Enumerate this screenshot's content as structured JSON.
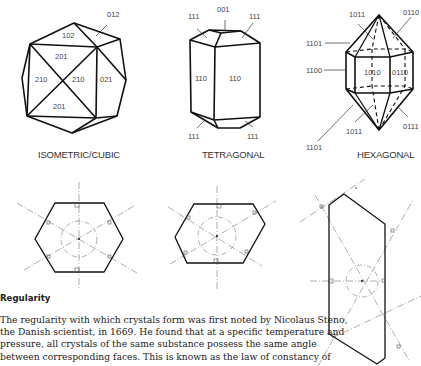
{
  "figure": {
    "crystals": [
      {
        "caption": "ISOMETRIC/CUBIC",
        "face_labels": [
          "012",
          "102",
          "201",
          "210",
          "210",
          "021",
          "201"
        ]
      },
      {
        "caption": "TETRAGONAL",
        "face_labels": [
          "001",
          "111",
          "111",
          "110",
          "110",
          "111",
          "111"
        ]
      },
      {
        "caption": "HEXAGONAL",
        "face_labels": [
          "1011",
          "0110",
          "1101",
          "1100",
          "1010",
          "0110",
          "1011",
          "0111",
          "1101"
        ]
      }
    ],
    "cross_sections": [
      {
        "name": "regular-hexagon-section"
      },
      {
        "name": "distorted-hexagon-section"
      },
      {
        "name": "elongated-hexagon-section"
      }
    ]
  },
  "section": {
    "heading": "Regularity",
    "lines": [
      "The regularity with which crystals form was first noted by Nicolaus Steno,",
      "the Danish scientist, in 1669. He found that at a specific temperature and",
      "pressure, all crystals of the same substance possess the same angle",
      "between corresponding faces. This is known as the law of constancy of"
    ]
  }
}
